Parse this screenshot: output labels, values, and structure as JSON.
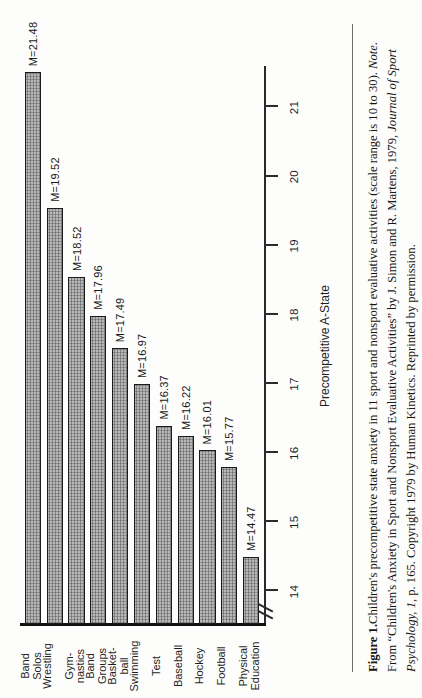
{
  "figure": {
    "label": "Figure 1.",
    "caption_part_1": "Children's precompetitive state anxiety in 11 sport and nonsport evaluative activities (scale range is 10 to 30). ",
    "note_word": "Note.",
    "caption_part_2": " From “Children's Anxiety in Sport and Nonsport Evaluative Activities” by J. Simon and R. Martens, 1979, ",
    "journal": "Journal of Sport Psychology, 1",
    "caption_part_3": ", p. 165. Copyright 1979 by Human Kinetics. Reprinted by permission."
  },
  "chart_data": {
    "type": "bar",
    "title": "",
    "xlabel": "",
    "ylabel": "Precompetitive A-State",
    "orientation": "vertical",
    "ylim": [
      13.5,
      21.6
    ],
    "axis_break": true,
    "axis_break_note": "y-axis broken below 14",
    "grid": false,
    "legend": "none",
    "tick_labels": [
      "14",
      "15",
      "16",
      "17",
      "18",
      "19",
      "20",
      "21"
    ],
    "ticks": [
      14,
      15,
      16,
      17,
      18,
      19,
      20,
      21
    ],
    "categories": [
      "Physical Education",
      "Football",
      "Hockey",
      "Baseball",
      "Test",
      "Swimming",
      "Basket- ball",
      "Band Groups",
      "Gym- nastics",
      "Wrestling",
      "Band Solos"
    ],
    "values": [
      14.47,
      15.77,
      16.01,
      16.22,
      16.37,
      16.97,
      17.49,
      17.96,
      18.52,
      19.52,
      21.48
    ],
    "value_labels": [
      "M=14.47",
      "M=15.77",
      "M=16.01",
      "M=16.22",
      "M=16.37",
      "M=16.97",
      "M=17.49",
      "M=17.96",
      "M=18.52",
      "M=19.52",
      "M=21.48"
    ],
    "bar_fill": "#b9b9b9",
    "bar_edge": "#1b1b1b"
  }
}
